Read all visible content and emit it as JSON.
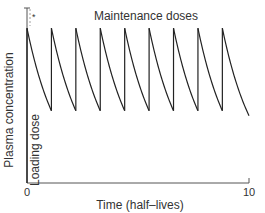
{
  "chart_data": {
    "type": "line",
    "title": "",
    "xlabel": "Time (half–lives)",
    "ylabel": "Plasma concentration",
    "xlim": [
      0,
      10
    ],
    "ylim": [
      0,
      1.15
    ],
    "x_ticks": [
      {
        "value": 0,
        "label": "0"
      },
      {
        "value": 10,
        "label": "10"
      }
    ],
    "grid": false,
    "legend": null,
    "series": [
      {
        "name": "Plasma concentration",
        "color": "#222222",
        "dose_times": [
          0,
          1.1,
          2.2,
          3.3,
          4.4,
          5.5,
          6.6,
          7.7,
          8.8
        ],
        "peak_concentration": 1.0,
        "decay": "exponential, halving every 1 half-life",
        "end_time": 10
      }
    ],
    "annotations": [
      {
        "text": "Maintenance doses",
        "position": "top-center"
      },
      {
        "text": "Loading dose",
        "position": "left, vertical along y-axis"
      },
      {
        "text": "*",
        "position": "top-left near y-axis"
      }
    ]
  }
}
